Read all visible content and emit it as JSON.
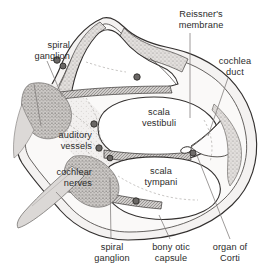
{
  "figure": {
    "kind": "anatomical-cross-section",
    "subject": "cochlea",
    "background_color": "#ffffff",
    "line_color": "#33302f",
    "tissue_fill": "#e9e7e5",
    "stipple_color": "#9a9693",
    "ganglion_fill": "#c9c6c3",
    "nerve_fill": "#d4d2cf",
    "vessel_color": "#4a4745",
    "membrane_color": "#6d6a68",
    "leader_color": "#7d7a78"
  },
  "labels": [
    {
      "id": "spiral-ganglion-top",
      "name": "spiral ganglion",
      "lines": [
        "spiral",
        "ganglion"
      ],
      "align": "right",
      "x": 8,
      "y": 40,
      "width": 62
    },
    {
      "id": "reissners-membrane",
      "name": "Reissner's membrane",
      "lines": [
        "Reissner's",
        "membrane"
      ],
      "align": "center",
      "x": 158,
      "y": 9,
      "width": 86
    },
    {
      "id": "cochlea-duct",
      "name": "cochlea duct",
      "lines": [
        "cochlea",
        "duct"
      ],
      "align": "center",
      "x": 204,
      "y": 56,
      "width": 62
    },
    {
      "id": "auditory-vessels",
      "name": "auditory vessels",
      "lines": [
        "auditory",
        "vessels"
      ],
      "align": "right",
      "x": 28,
      "y": 130,
      "width": 64
    },
    {
      "id": "cochlear-nerves",
      "name": "cochlear nerves",
      "lines": [
        "cochlear",
        "nerves"
      ],
      "align": "right",
      "x": 22,
      "y": 167,
      "width": 70
    },
    {
      "id": "scala-vestibuli",
      "name": "scala vestibuli",
      "lines": [
        "scala",
        "vestibuli"
      ],
      "align": "center",
      "x": 128,
      "y": 107,
      "width": 62
    },
    {
      "id": "scala-tympani",
      "name": "scala tympani",
      "lines": [
        "scala",
        "tympani"
      ],
      "align": "center",
      "x": 130,
      "y": 166,
      "width": 62
    },
    {
      "id": "spiral-ganglion-bottom",
      "name": "spiral ganglion",
      "lines": [
        "spiral",
        "ganglion"
      ],
      "align": "center",
      "x": 84,
      "y": 242,
      "width": 56
    },
    {
      "id": "bony-otic-capsule",
      "name": "bony otic capsule",
      "lines": [
        "bony otic",
        "capsule"
      ],
      "align": "center",
      "x": 142,
      "y": 242,
      "width": 58
    },
    {
      "id": "organ-of-corti",
      "name": "organ of Corti",
      "lines": [
        "organ of",
        "Corti"
      ],
      "align": "center",
      "x": 202,
      "y": 242,
      "width": 56
    }
  ],
  "leader_lines": [
    {
      "id": "leader-spiral-ganglion-top",
      "points": "47,61 62,96"
    },
    {
      "id": "leader-reissners-membrane",
      "points": "190,33 190,118"
    },
    {
      "id": "leader-cochlea-duct",
      "points": "228,78 208,136"
    },
    {
      "id": "leader-auditory-vessels-a",
      "points": "41,126 34,84"
    },
    {
      "id": "leader-cochlear-nerves",
      "points": "56,192 75,212"
    },
    {
      "id": "leader-spiral-ganglion-bottom",
      "points": "111,239 110,178"
    },
    {
      "id": "leader-bony-otic-capsule",
      "points": "170,239 159,215"
    },
    {
      "id": "leader-organ-of-corti",
      "points": "230,239 196,153"
    }
  ],
  "structures": [
    {
      "id": "bony-otic-capsule-outline",
      "name": "bony otic capsule"
    },
    {
      "id": "scala-vestibuli-chamber",
      "name": "scala vestibuli"
    },
    {
      "id": "scala-tympani-chamber",
      "name": "scala tympani"
    },
    {
      "id": "cochlea-duct-chamber",
      "name": "cochlear duct"
    },
    {
      "id": "apical-turn-chamber",
      "name": "apical turn"
    },
    {
      "id": "reissners-membrane-line",
      "name": "Reissner's membrane"
    },
    {
      "id": "basilar-membrane-line",
      "name": "basilar membrane"
    },
    {
      "id": "spiral-ganglion-upper-mass",
      "name": "spiral ganglion"
    },
    {
      "id": "spiral-ganglion-lower-mass",
      "name": "spiral ganglion"
    },
    {
      "id": "cochlear-nerve-trunk",
      "name": "cochlear nerves"
    },
    {
      "id": "modiolus-core",
      "name": "modiolus"
    },
    {
      "id": "organ-of-corti-mark",
      "name": "organ of Corti"
    },
    {
      "id": "auditory-vessel-dot",
      "name": "auditory vessel"
    }
  ]
}
